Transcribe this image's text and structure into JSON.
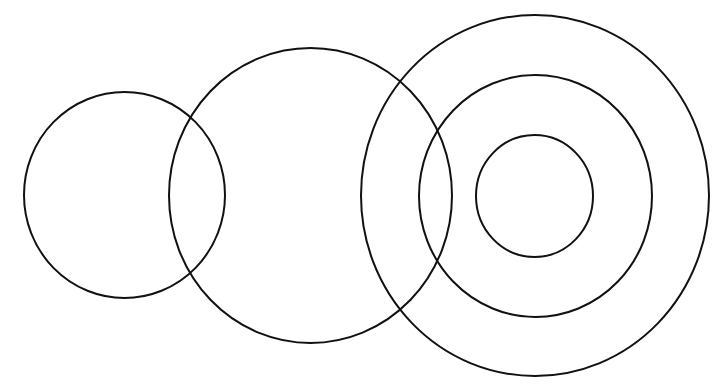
{
  "diagram": {
    "stroke_color": "#111111",
    "background_color": "#ffffff",
    "shapes": [
      {
        "id": "circle-left-small",
        "kind": "circle",
        "group": "left"
      },
      {
        "id": "circle-middle",
        "kind": "circle",
        "group": "middle"
      },
      {
        "id": "circle-concentric-outer",
        "kind": "circle",
        "group": "concentric"
      },
      {
        "id": "circle-concentric-middle",
        "kind": "circle",
        "group": "concentric"
      },
      {
        "id": "circle-concentric-inner",
        "kind": "circle",
        "group": "concentric"
      }
    ]
  }
}
